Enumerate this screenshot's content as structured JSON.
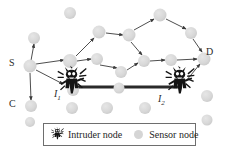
{
  "figure": {
    "background": "#ffffff",
    "width": 230,
    "height": 154
  },
  "colors": {
    "sensor_fill": "#d9d9d9",
    "sensor_fill_dark": "#cfcfcf",
    "edge": "#3a3a3a",
    "intruder": "#1c1c1c",
    "thick_link": "#2a2a2a",
    "legend_border": "#6e6e6e",
    "label_text": "#2b2b2b"
  },
  "labels": [
    {
      "id": "label-s",
      "text": "S",
      "x": 9,
      "y": 58,
      "italic": false
    },
    {
      "id": "label-c",
      "text": "C",
      "x": 9,
      "y": 99,
      "italic": false
    },
    {
      "id": "label-d",
      "text": "D",
      "x": 206,
      "y": 47,
      "italic": false
    },
    {
      "id": "label-i1",
      "text": "I",
      "sub": "1",
      "x": 54,
      "y": 89,
      "italic": true
    },
    {
      "id": "label-i2",
      "text": "I",
      "sub": "2",
      "x": 158,
      "y": 94,
      "italic": true
    }
  ],
  "sensor_nodes": [
    {
      "id": "n-s",
      "name": "source-node-s",
      "x": 30,
      "y": 66,
      "r": 6.5
    },
    {
      "id": "n-c",
      "name": "sensor-node-c",
      "x": 31,
      "y": 106,
      "r": 6.0
    },
    {
      "id": "n-d",
      "name": "destination-node-d",
      "x": 204,
      "y": 59,
      "r": 6.5
    },
    {
      "id": "n-1",
      "name": "sensor-node",
      "x": 34,
      "y": 38,
      "r": 6.0
    },
    {
      "id": "n-2",
      "name": "sensor-node",
      "x": 70,
      "y": 13,
      "r": 6.0
    },
    {
      "id": "n-3",
      "name": "sensor-node",
      "x": 70,
      "y": 61,
      "r": 7.0
    },
    {
      "id": "n-4",
      "name": "sensor-node",
      "x": 99,
      "y": 32,
      "r": 6.5
    },
    {
      "id": "n-5",
      "name": "sensor-node",
      "x": 129,
      "y": 35,
      "r": 6.5
    },
    {
      "id": "n-6",
      "name": "sensor-node",
      "x": 160,
      "y": 15,
      "r": 6.5
    },
    {
      "id": "n-7",
      "name": "sensor-node",
      "x": 191,
      "y": 33,
      "r": 6.0
    },
    {
      "id": "n-8",
      "name": "sensor-node",
      "x": 97,
      "y": 59,
      "r": 6.0
    },
    {
      "id": "n-9",
      "name": "sensor-node",
      "x": 121,
      "y": 72,
      "r": 6.0
    },
    {
      "id": "n-10",
      "name": "sensor-node",
      "x": 144,
      "y": 61,
      "r": 6.0
    },
    {
      "id": "n-11",
      "name": "sensor-node",
      "x": 171,
      "y": 60,
      "r": 6.0
    },
    {
      "id": "n-12",
      "name": "sensor-node",
      "x": 73,
      "y": 90,
      "r": 6.0
    },
    {
      "id": "n-13",
      "name": "sensor-node",
      "x": 72,
      "y": 108,
      "r": 6.0
    },
    {
      "id": "n-14",
      "name": "sensor-node",
      "x": 107,
      "y": 108,
      "r": 6.0
    },
    {
      "id": "n-15",
      "name": "sensor-node",
      "x": 145,
      "y": 108,
      "r": 6.0
    },
    {
      "id": "n-16",
      "name": "sensor-node",
      "x": 207,
      "y": 96,
      "r": 6.0
    },
    {
      "id": "n-17",
      "name": "sensor-node",
      "x": 119,
      "y": 88,
      "r": 5.5
    },
    {
      "id": "n-18",
      "name": "sensor-node",
      "x": 207,
      "y": 120,
      "r": 5.5
    },
    {
      "id": "n-19",
      "name": "sensor-node",
      "x": 30,
      "y": 122,
      "r": 5.0
    }
  ],
  "edges": [
    {
      "name": "edge-s-to-n1",
      "x1": 30,
      "y1": 66,
      "x2": 34,
      "y2": 44,
      "arrow": true
    },
    {
      "name": "edge-s-to-n3",
      "x1": 36,
      "y1": 64,
      "x2": 64,
      "y2": 60,
      "arrow": true
    },
    {
      "name": "edge-s-to-i1",
      "x1": 36,
      "y1": 70,
      "x2": 63,
      "y2": 84,
      "arrow": true
    },
    {
      "name": "edge-s-to-c",
      "x1": 30,
      "y1": 73,
      "x2": 31,
      "y2": 100,
      "arrow": true
    },
    {
      "name": "edge-n3-to-n4",
      "x1": 76,
      "y1": 56,
      "x2": 94,
      "y2": 38,
      "arrow": true
    },
    {
      "name": "edge-n3-to-n8",
      "x1": 77,
      "y1": 61,
      "x2": 91,
      "y2": 59,
      "arrow": true
    },
    {
      "name": "edge-n4-to-n5",
      "x1": 106,
      "y1": 33,
      "x2": 123,
      "y2": 35,
      "arrow": true
    },
    {
      "name": "edge-n5-to-n6",
      "x1": 134,
      "y1": 30,
      "x2": 154,
      "y2": 19,
      "arrow": true
    },
    {
      "name": "edge-n6-to-n7",
      "x1": 166,
      "y1": 19,
      "x2": 186,
      "y2": 29,
      "arrow": true
    },
    {
      "name": "edge-n5-to-n10",
      "x1": 131,
      "y1": 42,
      "x2": 142,
      "y2": 55,
      "arrow": true
    },
    {
      "name": "edge-n8-to-n9",
      "x1": 100,
      "y1": 65,
      "x2": 117,
      "y2": 68,
      "arrow": true
    },
    {
      "name": "edge-n9-to-n10",
      "x1": 127,
      "y1": 70,
      "x2": 138,
      "y2": 63,
      "arrow": true
    },
    {
      "name": "edge-n10-to-n11",
      "x1": 150,
      "y1": 61,
      "x2": 165,
      "y2": 60,
      "arrow": true
    },
    {
      "name": "edge-n11-to-d",
      "x1": 177,
      "y1": 60,
      "x2": 197,
      "y2": 59,
      "arrow": true
    },
    {
      "name": "edge-n7-to-d",
      "x1": 193,
      "y1": 39,
      "x2": 202,
      "y2": 52,
      "arrow": true
    },
    {
      "name": "edge-i2-to-d",
      "x1": 186,
      "y1": 81,
      "x2": 200,
      "y2": 64,
      "arrow": true
    }
  ],
  "thick_link": {
    "name": "intruder-wormhole-link",
    "x1": 78,
    "y1": 87,
    "x2": 180,
    "y2": 87,
    "width": 3
  },
  "intruders": [
    {
      "id": "intruder-1",
      "name": "intruder-node-i1",
      "x": 72,
      "y": 80,
      "scale": 1.0
    },
    {
      "id": "intruder-2",
      "name": "intruder-node-i2",
      "x": 180,
      "y": 80,
      "scale": 1.0
    }
  ],
  "legend": {
    "box": {
      "x": 43,
      "y": 123,
      "width": 153,
      "height": 23
    },
    "entries": [
      {
        "id": "legend-intruder",
        "icon": "intruder-icon",
        "label": "Intruder node"
      },
      {
        "id": "legend-sensor",
        "icon": "sensor-dot-icon",
        "label": "Sensor node"
      }
    ]
  }
}
